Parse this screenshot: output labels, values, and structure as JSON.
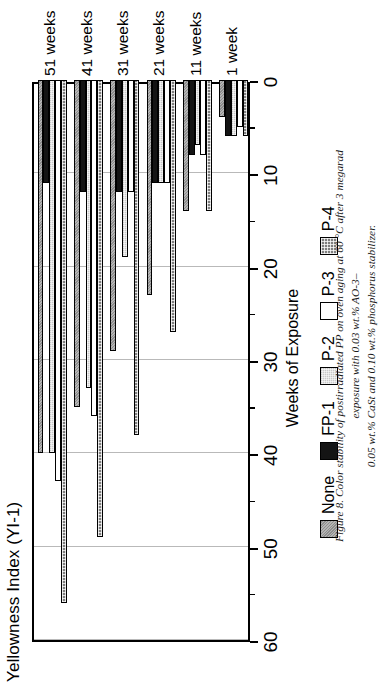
{
  "figure": {
    "caption_line1": "Figure 8. Color stability of postirradiated PP on oven aging at 60 °C after 3 megarad exposure with 0.03 wt.% AO-3–",
    "caption_line2": "0.05 wt.% CaSt and 0.10 wt.% phosphorus stabilizer."
  },
  "chart_data": {
    "type": "bar",
    "orientation": "horizontal",
    "title": "Yellowness Index (YI-1)",
    "xlabel": "Weeks of Exposure",
    "ylabel": "Yellowness Index (YI-1)",
    "categories": [
      "1 week",
      "11 weeks",
      "21 weeks",
      "31 weeks",
      "41 weeks",
      "51 weeks"
    ],
    "value_axis_ticks": [
      "60",
      "50",
      "40",
      "30",
      "20",
      "10",
      "0"
    ],
    "value_axis_min": 0,
    "value_axis_max": 60,
    "value_axis_reversed": true,
    "grid": true,
    "legend_position": "bottom",
    "series": [
      {
        "name": "None",
        "fill": "fill-none",
        "values": [
          4,
          14,
          23,
          29,
          35,
          40
        ]
      },
      {
        "name": "FP-1",
        "fill": "fill-fp1",
        "values": [
          6,
          8,
          11,
          12,
          12,
          11
        ]
      },
      {
        "name": "P-2",
        "fill": "fill-p2",
        "values": [
          6,
          7,
          11,
          19,
          33,
          40
        ]
      },
      {
        "name": "P-3",
        "fill": "fill-p3",
        "values": [
          5,
          8,
          11,
          12,
          36,
          43
        ]
      },
      {
        "name": "P-4",
        "fill": "fill-p4",
        "values": [
          6,
          14,
          27,
          38,
          49,
          56
        ]
      }
    ],
    "colors": {
      "none": "#8d8d8d",
      "fp1": "#141414",
      "p2": "#c9c9c9",
      "p3": "#ffffff",
      "p4": "#7f7f7f",
      "gridline": "#b9b9b9",
      "axis": "#000000"
    }
  },
  "legend": {
    "items": [
      {
        "label": "None",
        "fill": "fill-none"
      },
      {
        "label": "FP-1",
        "fill": "fill-fp1"
      },
      {
        "label": "P-2",
        "fill": "fill-p2"
      },
      {
        "label": "P-3",
        "fill": "fill-p3"
      },
      {
        "label": "P-4",
        "fill": "fill-p4"
      }
    ]
  }
}
